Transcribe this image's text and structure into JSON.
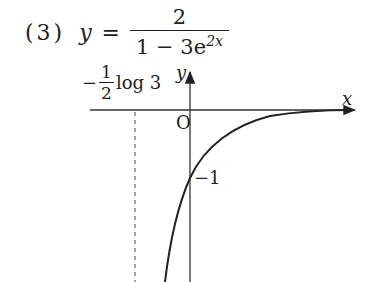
{
  "problem": {
    "number": "(3)",
    "lhs": "y",
    "equals": "=",
    "numerator": "2",
    "denominator_base": "1 − 3e",
    "denominator_exp": "2x"
  },
  "graph": {
    "x_axis_label": "x",
    "y_axis_label": "y",
    "origin_label": "O",
    "y_intercept_label": "−1",
    "asymptote_label": {
      "sign": "−",
      "frac_num": "1",
      "frac_den": "2",
      "text": "log 3"
    },
    "colors": {
      "line": "#222222",
      "axis": "#333333"
    }
  }
}
